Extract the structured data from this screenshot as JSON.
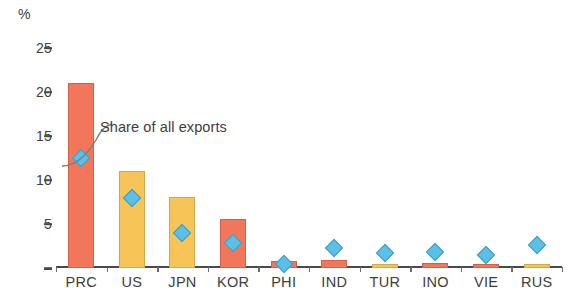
{
  "chart_data": {
    "type": "bar",
    "title": "",
    "subtitle": "",
    "xlabel": "",
    "ylabel": "%",
    "unit_label": "%",
    "ylim": [
      0,
      25
    ],
    "yticks": [
      0,
      5,
      10,
      15,
      20,
      25
    ],
    "ytick_labels": [
      "–",
      "5",
      "10",
      "15",
      "20",
      "25"
    ],
    "grid": false,
    "legend_position": "inline-annotation",
    "annotations": [
      {
        "text": "Share of all exports",
        "points_to": "PRC share marker",
        "marker_type": "diamond"
      }
    ],
    "categories": [
      "PRC",
      "US",
      "JPN",
      "KOR",
      "PHI",
      "IND",
      "TUR",
      "INO",
      "VIE",
      "RUS"
    ],
    "series": [
      {
        "name": "Bar value",
        "type": "bar",
        "values": [
          21.0,
          11.0,
          8.1,
          5.6,
          0.8,
          0.9,
          0.5,
          0.6,
          0.5,
          0.4
        ],
        "colors": [
          "orange",
          "amber",
          "amber",
          "orange",
          "orange",
          "orange",
          "amber",
          "orange",
          "orange",
          "amber"
        ]
      },
      {
        "name": "Share of all exports",
        "type": "marker",
        "marker": "diamond",
        "color": "#5BBFE8",
        "values": [
          12.5,
          8.0,
          4.0,
          2.8,
          0.4,
          2.3,
          1.7,
          1.8,
          1.5,
          2.6
        ]
      }
    ],
    "colors": {
      "orange": "#F2775A",
      "amber": "#F7C557",
      "marker_blue": "#5BBFE8",
      "axis": "#4a4a4a",
      "text": "#3d3d3d"
    }
  }
}
